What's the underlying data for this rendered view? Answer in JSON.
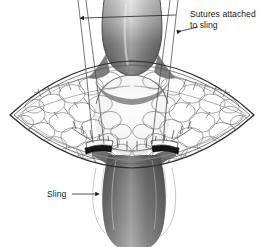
{
  "figure": {
    "type": "medical-surgical-illustration",
    "background_color": "#ffffff",
    "ink_color": "#1a1a1a",
    "line_color": "#3a3a3a",
    "tissue_outline_color": "#4a4a4a",
    "shading_dark": "#4a4a4a",
    "shading_mid": "#9a9a9a",
    "shading_light": "#f2f2f2",
    "clip_color": "#111111"
  },
  "labels": {
    "sutures": {
      "line1": "Sutures attached",
      "line2": "to sling",
      "x": 190,
      "y": 14
    },
    "sling": {
      "text": "Sling",
      "x": 50,
      "y": 197
    }
  },
  "caption": {
    "text": "",
    "visible": false
  },
  "annotations": {
    "leader_sutures_horizontal": "double-arrow leader spanning suture pairs",
    "leader_sutures_diagonal": "arrow from text to right suture pair",
    "leader_sling": "arrow from Sling label to lower sling edge"
  },
  "structures": {
    "incision": "lens-shaped (eye-shaped) surgical opening",
    "tissue": "fatty subcutaneous tissue, cobblestone texture",
    "urethra_upper": "proximal bulbar urethra, gradient shaded",
    "urethra_lower": "distal bulbar urethra, gradient shaded",
    "sling_body": "pale oval sling beneath urethra",
    "clips": 2,
    "sutures": 4,
    "retraction_sutures": 2,
    "running_suture_line": "curved running stitch across tissue"
  }
}
